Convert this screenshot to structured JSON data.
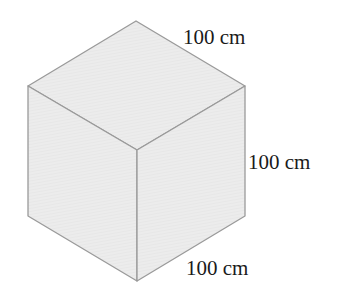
{
  "diagram": {
    "shape": "cube",
    "face_color": "#ebebeb",
    "edge_color": "#9a9a9a",
    "labels": {
      "top_edge": "100 cm",
      "right_edge": "100 cm",
      "bottom_edge": "100 cm"
    }
  }
}
